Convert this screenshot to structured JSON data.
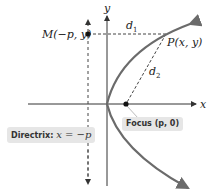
{
  "diagram": {
    "axes": {
      "x_label": "x",
      "y_label": "y"
    },
    "points": {
      "M": {
        "label": "M(−p, y)"
      },
      "P": {
        "label": "P(x, y)"
      },
      "focus": {
        "label_prefix": "Focus",
        "label_value": "(p, 0)"
      }
    },
    "distances": {
      "d1": "d",
      "d1_sub": "1",
      "d2": "d",
      "d2_sub": "2"
    },
    "directrix": {
      "label_prefix": "Directrix:",
      "label_eq": "x = −p"
    },
    "colors": {
      "curve": "#6b6b6b",
      "axis": "#333333",
      "dashed": "#444444",
      "label_box": "#e6e6e6"
    }
  }
}
